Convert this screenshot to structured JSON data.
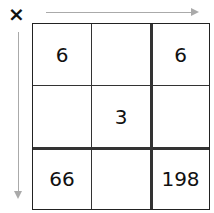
{
  "operator": "×",
  "grid": {
    "rows": [
      [
        "6",
        "",
        "6"
      ],
      [
        "",
        "3",
        ""
      ],
      [
        "66",
        "",
        "198"
      ]
    ]
  }
}
